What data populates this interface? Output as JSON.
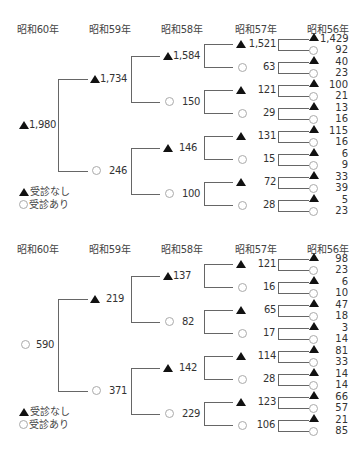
{
  "headers": [
    "昭和60年",
    "昭和59年",
    "昭和58年",
    "昭和57年",
    "昭和56年"
  ],
  "legend": {
    "no_visit": "受診なし",
    "visited": "受診あり"
  },
  "symbols": {
    "no_visit": "filled-triangle",
    "visited": "open-circle"
  },
  "trees": [
    {
      "name": "top-tree",
      "root": {
        "type": "triangle",
        "value": "1,980"
      },
      "level59": [
        {
          "type": "triangle",
          "value": "1,734"
        },
        {
          "type": "circle",
          "value": "246"
        }
      ],
      "level58": [
        {
          "type": "triangle",
          "value": "1,584"
        },
        {
          "type": "circle",
          "value": "150"
        },
        {
          "type": "triangle",
          "value": "146"
        },
        {
          "type": "circle",
          "value": "100"
        }
      ],
      "level57": [
        {
          "type": "triangle",
          "value": "1,521"
        },
        {
          "type": "circle",
          "value": "63"
        },
        {
          "type": "triangle",
          "value": "121"
        },
        {
          "type": "circle",
          "value": "29"
        },
        {
          "type": "triangle",
          "value": "131"
        },
        {
          "type": "circle",
          "value": "15"
        },
        {
          "type": "triangle",
          "value": "72"
        },
        {
          "type": "circle",
          "value": "28"
        }
      ],
      "level56": [
        {
          "type": "triangle",
          "value": "1,429"
        },
        {
          "type": "circle",
          "value": "92"
        },
        {
          "type": "triangle",
          "value": "40"
        },
        {
          "type": "circle",
          "value": "23"
        },
        {
          "type": "triangle",
          "value": "100"
        },
        {
          "type": "circle",
          "value": "21"
        },
        {
          "type": "triangle",
          "value": "13"
        },
        {
          "type": "circle",
          "value": "16"
        },
        {
          "type": "triangle",
          "value": "115"
        },
        {
          "type": "circle",
          "value": "16"
        },
        {
          "type": "triangle",
          "value": "6"
        },
        {
          "type": "circle",
          "value": "9"
        },
        {
          "type": "triangle",
          "value": "33"
        },
        {
          "type": "circle",
          "value": "39"
        },
        {
          "type": "triangle",
          "value": "5"
        },
        {
          "type": "circle",
          "value": "23"
        }
      ]
    },
    {
      "name": "bottom-tree",
      "root": {
        "type": "circle",
        "value": "590"
      },
      "level59": [
        {
          "type": "triangle",
          "value": "219"
        },
        {
          "type": "circle",
          "value": "371"
        }
      ],
      "level58": [
        {
          "type": "triangle",
          "value": "137"
        },
        {
          "type": "circle",
          "value": "82"
        },
        {
          "type": "triangle",
          "value": "142"
        },
        {
          "type": "circle",
          "value": "229"
        }
      ],
      "level57": [
        {
          "type": "triangle",
          "value": "121"
        },
        {
          "type": "circle",
          "value": "16"
        },
        {
          "type": "triangle",
          "value": "65"
        },
        {
          "type": "circle",
          "value": "17"
        },
        {
          "type": "triangle",
          "value": "114"
        },
        {
          "type": "circle",
          "value": "28"
        },
        {
          "type": "triangle",
          "value": "123"
        },
        {
          "type": "circle",
          "value": "106"
        }
      ],
      "level56": [
        {
          "type": "triangle",
          "value": "98"
        },
        {
          "type": "circle",
          "value": "23"
        },
        {
          "type": "triangle",
          "value": "6"
        },
        {
          "type": "circle",
          "value": "10"
        },
        {
          "type": "triangle",
          "value": "47"
        },
        {
          "type": "circle",
          "value": "18"
        },
        {
          "type": "triangle",
          "value": "3"
        },
        {
          "type": "circle",
          "value": "14"
        },
        {
          "type": "triangle",
          "value": "81"
        },
        {
          "type": "circle",
          "value": "33"
        },
        {
          "type": "triangle",
          "value": "14"
        },
        {
          "type": "circle",
          "value": "14"
        },
        {
          "type": "triangle",
          "value": "66"
        },
        {
          "type": "circle",
          "value": "57"
        },
        {
          "type": "triangle",
          "value": "21"
        },
        {
          "type": "circle",
          "value": "85"
        }
      ]
    }
  ]
}
